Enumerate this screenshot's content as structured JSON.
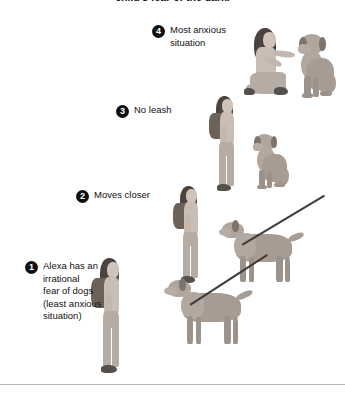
{
  "caption": {
    "text": "child's fear of the dark."
  },
  "steps": [
    {
      "number": "1",
      "label": "Alexa has an\nirrational\nfear of dogs\n(least anxious\nsituation)",
      "scene": "girl-standing-with-backpack-and-leashed-dog"
    },
    {
      "number": "2",
      "label": "Moves closer",
      "scene": "girl-standing-nearer-leashed-dog"
    },
    {
      "number": "3",
      "label": "No leash",
      "scene": "girl-standing-with-unleashed-sitting-dog"
    },
    {
      "number": "4",
      "label": "Most anxious\nsituation",
      "scene": "girl-kneeling-petting-dog"
    }
  ],
  "colors": {
    "badge_fill": "#101010",
    "badge_text": "#ffffff",
    "text": "#111111",
    "rule": "#b6b6b6",
    "background": "#ffffff",
    "figure_skin": "#c9bdb4",
    "figure_hair": "#4a4340",
    "backpack": "#6d6259",
    "dog_body": "#a79c93",
    "leash": "#3d3a37"
  },
  "divider": {
    "name": "bottom-rule"
  }
}
